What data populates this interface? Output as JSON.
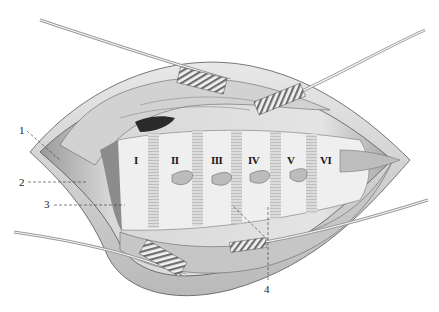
{
  "figure": {
    "type": "anatomical illustration",
    "style": "grayscale pencil engraving",
    "callouts": [
      {
        "id": "1",
        "label": "1",
        "x": 19,
        "y": 125
      },
      {
        "id": "2",
        "label": "2",
        "x": 19,
        "y": 178
      },
      {
        "id": "3",
        "label": "3",
        "x": 44,
        "y": 199
      },
      {
        "id": "4",
        "label": "4",
        "x": 264,
        "y": 284
      }
    ],
    "segments": [
      {
        "label": "I",
        "x": 133,
        "y": 157
      },
      {
        "label": "II",
        "x": 170,
        "y": 157
      },
      {
        "label": "III",
        "x": 210,
        "y": 157
      },
      {
        "label": "IV",
        "x": 247,
        "y": 157
      },
      {
        "label": "V",
        "x": 287,
        "y": 157
      },
      {
        "label": "VI",
        "x": 320,
        "y": 157
      }
    ]
  },
  "colors": {
    "background": "#ffffff",
    "tissue_light": "#efefef",
    "tissue_mid": "#c9c9c9",
    "tissue_dark": "#7a7a7a",
    "ink": "#222222"
  }
}
